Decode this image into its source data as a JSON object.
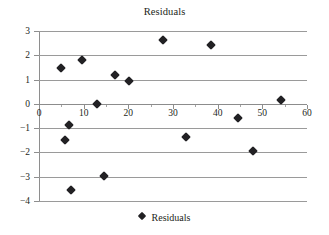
{
  "chart_data": {
    "type": "scatter",
    "title": "Residuals",
    "xlabel": "",
    "ylabel": "",
    "xlim": [
      0,
      60
    ],
    "ylim": [
      -4,
      3
    ],
    "grid": true,
    "legend_position": "bottom",
    "series": [
      {
        "name": "Residuals",
        "marker": "diamond",
        "color": "#222124",
        "points": [
          {
            "x": 4.9,
            "y": 1.48
          },
          {
            "x": 5.8,
            "y": -1.48
          },
          {
            "x": 6.7,
            "y": -0.86
          },
          {
            "x": 7.2,
            "y": -3.54
          },
          {
            "x": 9.6,
            "y": 1.81
          },
          {
            "x": 13.0,
            "y": 0.0
          },
          {
            "x": 14.5,
            "y": -2.96
          },
          {
            "x": 17.0,
            "y": 1.19
          },
          {
            "x": 20.1,
            "y": 0.95
          },
          {
            "x": 27.7,
            "y": 2.63
          },
          {
            "x": 32.9,
            "y": -1.36
          },
          {
            "x": 38.5,
            "y": 2.43
          },
          {
            "x": 44.5,
            "y": -0.58
          },
          {
            "x": 47.9,
            "y": -1.93
          },
          {
            "x": 54.1,
            "y": 0.16
          }
        ]
      }
    ],
    "xticks": [
      0,
      10,
      20,
      30,
      40,
      50,
      60
    ],
    "xtick_labels": [
      "0",
      "10",
      "20",
      "30",
      "40",
      "50",
      "60"
    ],
    "yticks": [
      3,
      2,
      1,
      0,
      -1,
      -2,
      -3,
      -4
    ],
    "ytick_labels": [
      "3",
      "2",
      "1",
      "0",
      "−1",
      "−2",
      "−3",
      "−4"
    ]
  },
  "legend": {
    "entries": [
      {
        "label": "Residuals",
        "marker": "diamond-icon",
        "color": "#222124"
      }
    ]
  },
  "colors": {
    "marker": "#222124",
    "gridline": "#9a9a9a",
    "axis": "#8e8e8e",
    "text": "#231f20",
    "background": "#ffffff"
  }
}
